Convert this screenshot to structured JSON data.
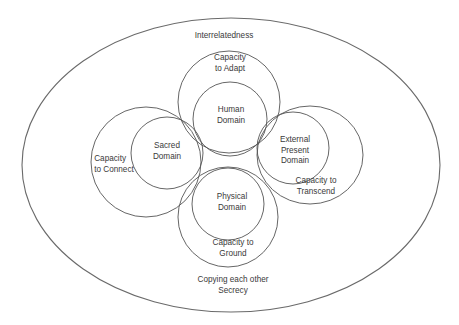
{
  "diagram": {
    "outer": {
      "label": "Interrelatedness",
      "bottom_line1": "Copying each other",
      "bottom_line2": "Secrecy"
    },
    "clusters": [
      {
        "key": "top",
        "capacity_line1": "Capacity",
        "capacity_line2": "to Adapt",
        "domain_line1": "Human",
        "domain_line2": "Domain"
      },
      {
        "key": "left",
        "capacity_line1": "Capacity",
        "capacity_line2": "to Connect",
        "domain_line1": "Sacred",
        "domain_line2": "Domain"
      },
      {
        "key": "right",
        "capacity_line1": "Capacity to",
        "capacity_line2": "Transcend",
        "domain_line1": "External",
        "domain_line2": "Present",
        "domain_line3": "Domain"
      },
      {
        "key": "bottom",
        "capacity_line1": "Capacity to",
        "capacity_line2": "Ground",
        "domain_line1": "Physical",
        "domain_line2": "Domain"
      }
    ]
  }
}
